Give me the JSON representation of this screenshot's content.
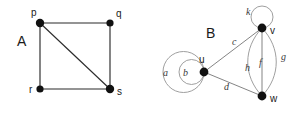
{
  "figure": {
    "width": 300,
    "height": 113,
    "background": "#ffffff",
    "stroke_color": "#2b2b2b",
    "light_stroke_color": "#9a9a9a",
    "vertex_color": "#111111"
  },
  "graphs": [
    {
      "id": "graph-a",
      "name": "A",
      "caption": "A",
      "vertices": [
        {
          "id": "p",
          "label": "p",
          "x": 40,
          "y": 23,
          "r": 4.2,
          "label_x": 31,
          "label_y": 16
        },
        {
          "id": "q",
          "label": "q",
          "x": 110,
          "y": 23,
          "r": 3.6,
          "label_x": 116,
          "label_y": 17
        },
        {
          "id": "r",
          "label": "r",
          "x": 40,
          "y": 89,
          "r": 3.6,
          "label_x": 29,
          "label_y": 93
        },
        {
          "id": "s",
          "label": "s",
          "x": 110,
          "y": 89,
          "r": 4.2,
          "label_x": 117,
          "label_y": 95
        }
      ],
      "edges": [
        {
          "id": "pq",
          "from": "p",
          "to": "q",
          "label": "",
          "kind": "straight"
        },
        {
          "id": "pr",
          "from": "p",
          "to": "r",
          "label": "",
          "kind": "straight"
        },
        {
          "id": "qs",
          "from": "q",
          "to": "s",
          "label": "",
          "kind": "straight"
        },
        {
          "id": "rs",
          "from": "r",
          "to": "s",
          "label": "",
          "kind": "straight"
        },
        {
          "id": "ps",
          "from": "p",
          "to": "s",
          "label": "",
          "kind": "diagonal"
        }
      ],
      "caption_x": 17,
      "caption_y": 46
    },
    {
      "id": "graph-b",
      "name": "B",
      "caption": "B",
      "vertices": [
        {
          "id": "u",
          "label": "u",
          "x": 204,
          "y": 72,
          "r": 4.4,
          "label_x": 199,
          "label_y": 63
        },
        {
          "id": "v",
          "label": "v",
          "x": 262,
          "y": 28,
          "r": 4.4,
          "label_x": 270,
          "label_y": 34
        },
        {
          "id": "w",
          "label": "w",
          "x": 262,
          "y": 96,
          "r": 4.4,
          "label_x": 270,
          "label_y": 102
        }
      ],
      "edges": [
        {
          "id": "a",
          "label": "a",
          "kind": "self-loop",
          "at": "u",
          "label_x": 163,
          "label_y": 76
        },
        {
          "id": "b",
          "label": "b",
          "kind": "self-loop",
          "at": "u",
          "label_x": 183,
          "label_y": 76
        },
        {
          "id": "c",
          "label": "c",
          "kind": "straight",
          "from": "u",
          "to": "v",
          "label_x": 232,
          "label_y": 45
        },
        {
          "id": "d",
          "label": "d",
          "kind": "straight",
          "from": "u",
          "to": "w",
          "label_x": 224,
          "label_y": 90
        },
        {
          "id": "f",
          "label": "f",
          "kind": "straight",
          "from": "v",
          "to": "w",
          "label_x": 259,
          "label_y": 66
        },
        {
          "id": "g",
          "label": "g",
          "kind": "arc-right",
          "from": "v",
          "to": "w",
          "label_x": 281,
          "label_y": 60
        },
        {
          "id": "h",
          "label": "h",
          "kind": "arc-left",
          "from": "v",
          "to": "w",
          "label_x": 245,
          "label_y": 71
        },
        {
          "id": "k",
          "label": "k",
          "kind": "self-loop",
          "at": "v",
          "label_x": 246,
          "label_y": 15
        }
      ],
      "caption_x": 206,
      "caption_y": 38
    }
  ]
}
